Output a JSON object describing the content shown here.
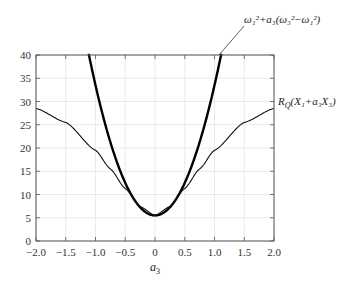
{
  "chart_data": {
    "type": "line",
    "title": "",
    "xlabel": "a3",
    "ylabel": "",
    "xlim": [
      -2.0,
      2.0
    ],
    "ylim": [
      0,
      40
    ],
    "grid": true,
    "x_ticks": [
      "-2.0",
      "-1.5",
      "-1.0",
      "-0.5",
      "0",
      "0.5",
      "1.0",
      "1.5",
      "2.0"
    ],
    "y_ticks": [
      "0",
      "5",
      "10",
      "15",
      "20",
      "25",
      "30",
      "35",
      "40"
    ],
    "series": [
      {
        "name": "ω1^2 + a3(ω3^2 − ω1^2)",
        "style": "thick",
        "x": [
          -1.12,
          -1.0,
          -0.75,
          -0.5,
          -0.25,
          0.0,
          0.25,
          0.5,
          0.75,
          1.0,
          1.12
        ],
        "y": [
          40.0,
          33.5,
          21.3,
          12.5,
          7.3,
          5.5,
          7.3,
          12.5,
          21.3,
          33.5,
          40.0
        ]
      },
      {
        "name": "RQ(X1 + a3X3)",
        "style": "thin",
        "x": [
          -2.0,
          -1.5,
          -1.0,
          -0.75,
          -0.5,
          -0.25,
          0.0,
          0.25,
          0.5,
          0.75,
          1.0,
          1.5,
          2.0
        ],
        "y": [
          28.5,
          25.5,
          19.5,
          15.5,
          11.3,
          7.4,
          5.5,
          7.4,
          11.3,
          15.5,
          19.5,
          25.5,
          28.5
        ]
      }
    ],
    "annotations": [
      {
        "text": "ω₁²+a₃(ω₃²−ω₁²)",
        "points_to": "thick curve at y=40, x≈1.1"
      },
      {
        "text": "R_Q(X₁+a₃X₃)",
        "position": "right of plot at y≈28.5"
      }
    ]
  },
  "labels": {
    "xlabel_main": "a",
    "xlabel_sub": "3",
    "annot_top": "ω₁²+a₃(ω₃²−ω₁²)",
    "annot_right_R": "R",
    "annot_right_Q": "Q",
    "annot_right_rest": "(X₁+a₃X₃)"
  }
}
